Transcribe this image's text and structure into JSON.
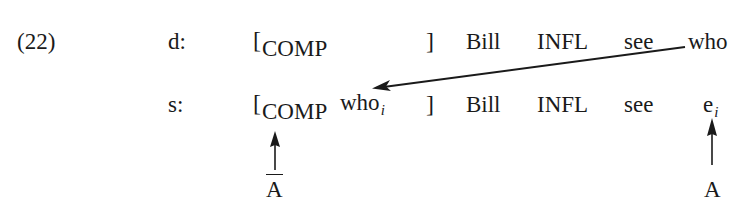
{
  "example": {
    "number": "(22)",
    "rows": [
      {
        "label": "d:",
        "comp_bracket_open": "[",
        "comp_label": "COMP",
        "comp_content": "",
        "comp_bracket_close": "]",
        "words": [
          "Bill",
          "INFL",
          "see",
          "who"
        ]
      },
      {
        "label": "s:",
        "comp_bracket_open": "[",
        "comp_label": "COMP",
        "comp_content": "who",
        "comp_content_index": "i",
        "comp_bracket_close": "]",
        "words": [
          "Bill",
          "INFL",
          "see",
          "e"
        ],
        "trace_index": "i"
      }
    ],
    "annotations": {
      "left_label": "A",
      "left_label_overbar": true,
      "right_label": "A",
      "right_label_overbar": false
    },
    "arrows": [
      {
        "name": "movement-arrow",
        "from": "d-row who",
        "to": "s-row COMP who_i"
      },
      {
        "name": "a-bar-position-arrow",
        "from": "A-bar label",
        "to": "COMP"
      },
      {
        "name": "a-position-arrow",
        "from": "A label",
        "to": "e_i trace"
      }
    ]
  }
}
